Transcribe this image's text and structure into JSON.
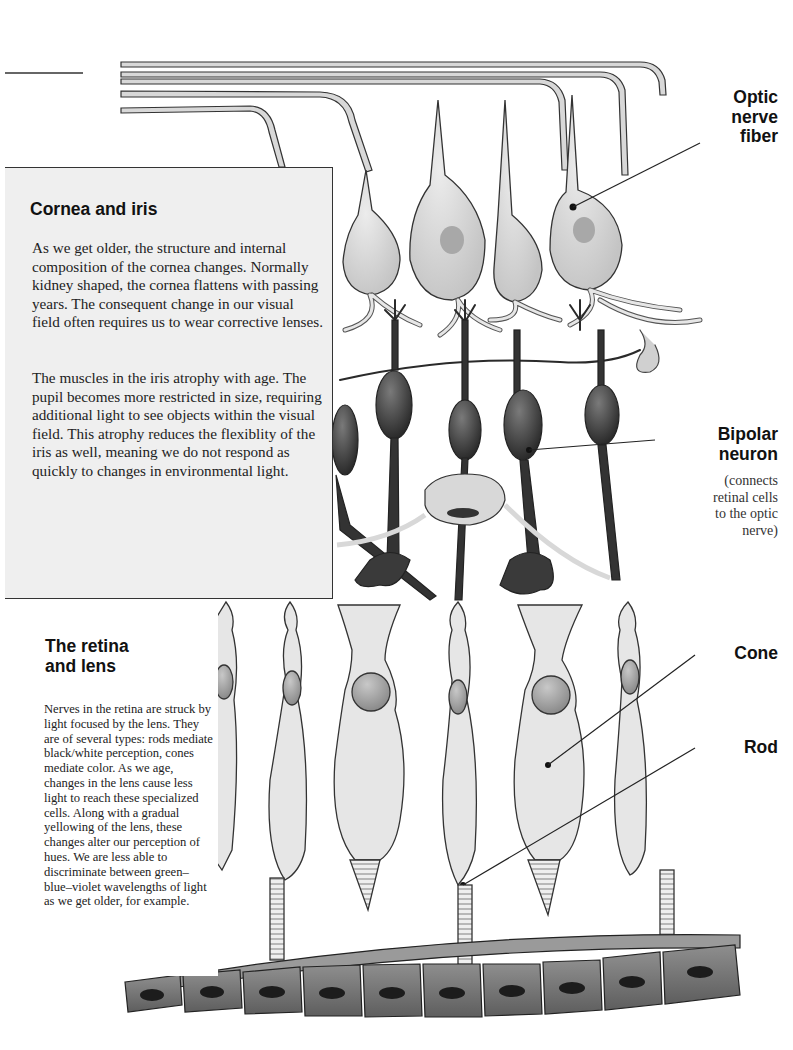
{
  "figure": {
    "labels": {
      "optic_nerve_fiber": "Optic\nnerve\nfiber",
      "bipolar_neuron": "Bipolar\nneuron",
      "bipolar_neuron_note": "(connects\nretinal cells\nto the optic\nnerve)",
      "cone": "Cone",
      "rod": "Rod"
    }
  },
  "cornea_panel": {
    "title": "Cornea and iris",
    "paragraph_1": "As we get older, the structure and internal composition of the cornea changes.  Normally kidney shaped, the cornea flattens with passing years. The consequent change in our visual field often requires us to wear corrective lenses.",
    "paragraph_2": "The muscles in the iris atrophy with age.  The pupil becomes more restricted in size, requiring additional light to see objects within the visual field.  This atrophy reduces the flexiblity of the iris as well, meaning we do not respond as quickly to changes in environmental light."
  },
  "retina_panel": {
    "title": "The retina\nand lens",
    "paragraph": "Nerves in the retina are struck by light focused by the lens.  They are of several types: rods mediate black/white perception, cones mediate color.  As we age, changes in the lens cause less light to reach these specialized cells.  Along with a gradual yellowing of the lens, these changes alter our perception of hues.   We are less able to discriminate between green–blue–violet wavelengths of light as we get older, for example."
  },
  "colors": {
    "ganglion_fill": "#d6d6d6",
    "bipolar_fill": "#3a3a3a",
    "photoreceptor_fill": "#e4e4e4",
    "epithelium_fill": "#7a7a7a",
    "panel_bg": "#efefef",
    "outline": "#222222"
  }
}
